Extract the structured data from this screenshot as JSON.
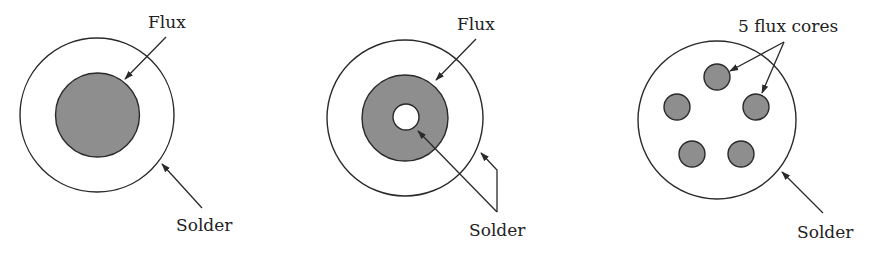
{
  "colors": {
    "flux_fill": "#8e8e8e",
    "solder_fill": "#ffffff",
    "stroke": "#2a2a2a"
  },
  "panels": [
    {
      "name": "single-core",
      "labels": {
        "top": "Flux",
        "bottom": "Solder"
      }
    },
    {
      "name": "annular-core",
      "labels": {
        "top": "Flux",
        "bottom": "Solder"
      }
    },
    {
      "name": "five-core",
      "labels": {
        "top": "5 flux cores",
        "bottom": "Solder"
      }
    }
  ]
}
